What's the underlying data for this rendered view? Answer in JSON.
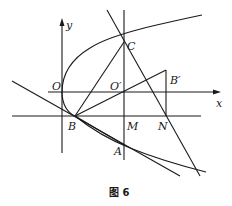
{
  "figure": {
    "caption": "图 6",
    "axes": {
      "x_label": "x",
      "y_label": "y"
    },
    "points": {
      "O": "O",
      "O_prime": "O′",
      "B": "B",
      "B_prime": "B′",
      "C": "C",
      "M": "M",
      "N": "N",
      "A": "A"
    },
    "elements": [
      "parabola opening right with vertex at O",
      "horizontal line through B, M, N",
      "vertical line through C, O', M, A",
      "segment B-C",
      "segment B-B'",
      "segment B'-N",
      "line C-N extended",
      "tangent line through B and A",
      "line through B extended to lower right"
    ]
  }
}
